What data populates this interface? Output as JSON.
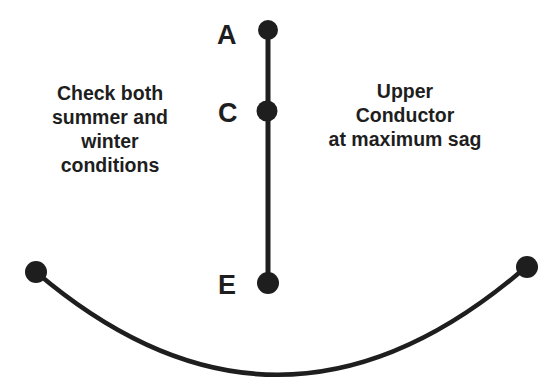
{
  "diagram": {
    "points": [
      {
        "label": "A",
        "x": 268,
        "y": 30
      },
      {
        "label": "C",
        "x": 267,
        "y": 110
      },
      {
        "label": "E",
        "x": 268,
        "y": 282
      }
    ],
    "left_note": [
      "Check both",
      "summer and",
      "winter",
      "conditions"
    ],
    "right_note": [
      "Upper",
      "Conductor",
      "at maximum sag"
    ],
    "conductor": {
      "left": {
        "x": 36,
        "y": 272
      },
      "right": {
        "x": 526,
        "y": 267
      },
      "bottom_y": 376
    },
    "colors": {
      "ink": "#1e1e1e",
      "background": "#ffffff"
    }
  }
}
